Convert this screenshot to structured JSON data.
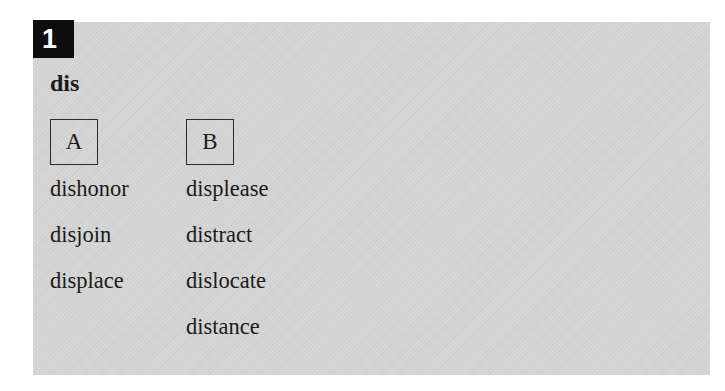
{
  "exercise": {
    "number": "1",
    "prefix": "dis",
    "colors": {
      "panel_background": "#d5d5d5",
      "badge_background": "#0d0d0d",
      "badge_text": "#ffffff",
      "text": "#1a1a1a"
    },
    "columns": [
      {
        "label": "A",
        "words": [
          "dishonor",
          "disjoin",
          "displace"
        ]
      },
      {
        "label": "B",
        "words": [
          "displease",
          "distract",
          "dislocate",
          "distance"
        ]
      }
    ]
  }
}
